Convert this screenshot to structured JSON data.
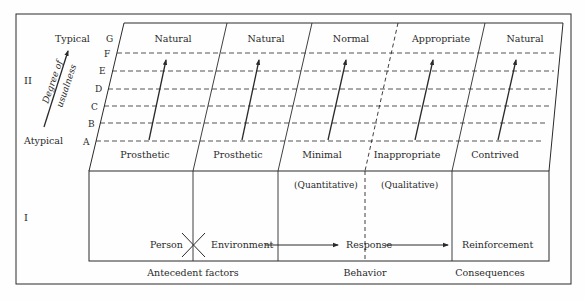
{
  "figure": {
    "section_labels": {
      "upper": "II",
      "lower": "I"
    },
    "scale": {
      "top_label": "Typical",
      "bottom_label": "Atypical",
      "arrow_label_line1": "Degree of",
      "arrow_label_line2": "usualness",
      "levels": [
        "G",
        "F",
        "E",
        "D",
        "C",
        "B",
        "A"
      ]
    },
    "columns": [
      {
        "top": "Natural",
        "bottom": "Prosthetic"
      },
      {
        "top": "Natural",
        "bottom": "Prosthetic"
      },
      {
        "top": "Normal",
        "bottom": "Minimal"
      },
      {
        "top": "Appropriate",
        "bottom": "Inappropriate"
      },
      {
        "top": "Natural",
        "bottom": "Contrived"
      }
    ],
    "lower": {
      "quantitative": "(Quantitative)",
      "qualitative": "(Qualitative)",
      "person": "Person",
      "environment": "Environment",
      "response": "Response",
      "reinforcement": "Reinforcement",
      "footer": {
        "antecedent": "Antecedent factors",
        "behavior": "Behavior",
        "consequences": "Consequences"
      }
    },
    "colors": {
      "line": "#2a2a2a",
      "background": "#fefefe"
    }
  }
}
